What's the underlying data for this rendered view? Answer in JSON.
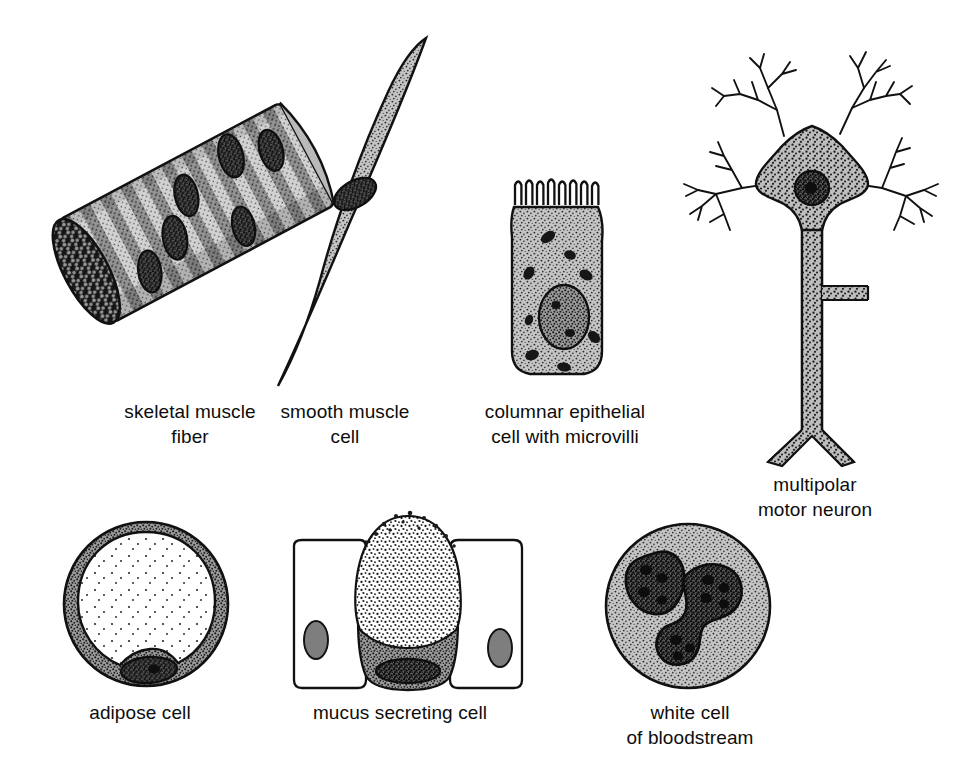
{
  "plate": {
    "background_color": "#ffffff",
    "width": 954,
    "height": 775,
    "style": "black-and-white stippled scientific line illustration"
  },
  "palette": {
    "ink": "#111111",
    "cytoplasm_light": "#c9c9c9",
    "cytoplasm_mid": "#b3b3b3",
    "cytoplasm_dark": "#8f8f8f",
    "striation_light": "#cfcfcf",
    "striation_dark": "#8c8c8c",
    "nucleus_dark": "#3a3a3a",
    "nucleus_mid": "#6e6e6e",
    "lipid_droplet": "#ffffff",
    "paper": "#ffffff"
  },
  "figures": [
    {
      "id": "skeletal-muscle-fiber",
      "caption": "skeletal muscle\nfiber",
      "caption_lines": [
        "skeletal muscle",
        "fiber"
      ],
      "caption_center_x": 190,
      "caption_top_y": 399,
      "row": 1,
      "column": 1,
      "description": "Tilted cylindrical fiber with transverse striations, several peripheral elliptical nuclei and a dark stippled cut end",
      "nuclei_count": 6,
      "striation_bands": 22,
      "tilt_degrees": -28
    },
    {
      "id": "smooth-muscle-cell",
      "caption": "smooth muscle\ncell",
      "caption_lines": [
        "smooth muscle",
        "cell"
      ],
      "caption_center_x": 345,
      "caption_top_y": 399,
      "row": 1,
      "column": 2,
      "description": "Elongated spindle-shaped cell tapering at both ends with a single central dark oval nucleus",
      "nuclei_count": 1,
      "tilt_degrees": -25
    },
    {
      "id": "columnar-epithelial-cell",
      "caption": "columnar epithelial\ncell with microvilli",
      "caption_lines": [
        "columnar epithelial",
        "cell with microvilli"
      ],
      "caption_center_x": 565,
      "caption_top_y": 399,
      "row": 1,
      "column": 3,
      "description": "Tall rectangular cell with a brush border of microvilli on the apical surface, large oval nucleus low in the cell and scattered dark mitochondria",
      "microvilli_count": 13,
      "nuclei_count": 1,
      "mitochondria_count": 9
    },
    {
      "id": "multipolar-motor-neuron",
      "caption": "multipolar\nmotor neuron",
      "caption_lines": [
        "multipolar",
        "motor neuron"
      ],
      "caption_center_x": 815,
      "caption_top_y": 472,
      "row": 1,
      "column": 4,
      "description": "Stippled star-shaped cell body with a round nucleus and nucleolus, four richly branching dendrites and one long axon bearing a collateral branch and a terminal fork",
      "dendrite_count": 4,
      "axon_collaterals": 1,
      "terminal_branches": 2
    },
    {
      "id": "adipose-cell",
      "caption": "adipose cell",
      "caption_lines": [
        "adipose cell"
      ],
      "caption_center_x": 140,
      "caption_top_y": 700,
      "row": 2,
      "column": 1,
      "description": "Round cell reduced to a thin stippled rim of cytoplasm around one enormous clear fat droplet, with the flattened nucleus pushed to the lower edge",
      "nuclei_count": 1
    },
    {
      "id": "mucus-secreting-cell",
      "caption": "mucus secreting cell",
      "caption_lines": [
        "mucus secreting cell"
      ],
      "caption_center_x": 400,
      "caption_top_y": 700,
      "row": 2,
      "column": 2,
      "description": "Goblet cell packed with pale mucigen granules spilling from its apex, dark basal cytoplasm containing the nucleus, flanked by two plain neighbouring epithelial cells",
      "neighbour_cells": 2,
      "nuclei_count": 3
    },
    {
      "id": "white-cell-of-bloodstream",
      "caption": "white cell\nof bloodstream",
      "caption_lines": [
        "white cell",
        "of bloodstream"
      ],
      "caption_center_x": 690,
      "caption_top_y": 700,
      "row": 2,
      "column": 3,
      "description": "Round granular leukocyte whose dark nucleus is divided into three lobes joined by slender chromatin strands",
      "nucleus_lobes": 3
    }
  ]
}
